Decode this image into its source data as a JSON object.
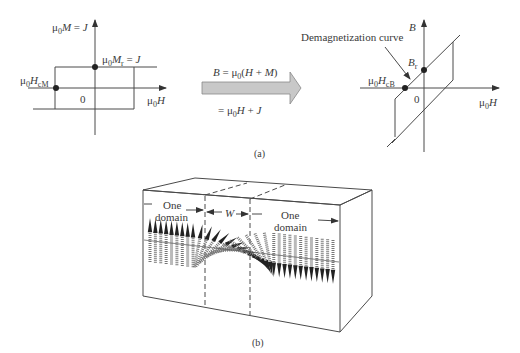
{
  "panel_a": {
    "caption": "(a)",
    "left_plot": {
      "y_axis_label": "μ0M = J",
      "x_axis_label": "μ0H",
      "origin_label": "0",
      "remanence_label": "μ0Mr = J",
      "coercivity_label": "μ0HcM",
      "loop_shape": "rectangular"
    },
    "transform_arrow": {
      "formula_top": "B = μ0(H + M)",
      "formula_bottom": "= μ0H + J",
      "fill_color": "#c8c8c8"
    },
    "right_plot": {
      "y_axis_label": "B",
      "x_axis_label": "μ0H",
      "origin_label": "0",
      "remanence_label": "Br",
      "coercivity_label": "μ0HcB",
      "annotation": "Demagnetization curve",
      "loop_shape": "parallelogram"
    }
  },
  "panel_b": {
    "caption": "(b)",
    "left_domain_label_line1": "One",
    "left_domain_label_line2": "domain",
    "right_domain_label_line1": "One",
    "right_domain_label_line2": "domain",
    "wall_width_label": "W",
    "left_domain_spin_count": 9,
    "wall_spin_count": 14,
    "right_domain_spin_count": 12
  }
}
